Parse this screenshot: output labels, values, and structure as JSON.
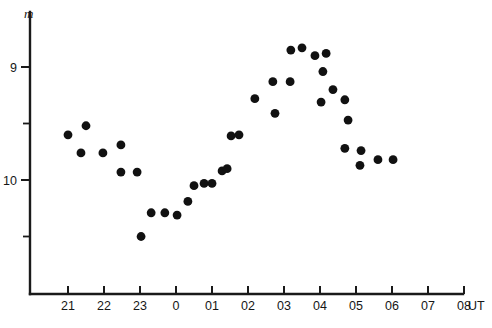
{
  "chart_data": {
    "type": "scatter",
    "title": "",
    "subtitle": "",
    "xlabel": "UT",
    "ylabel": "m",
    "y_axis_inverted": true,
    "grid": false,
    "legend": null,
    "xlim": [
      20.55,
      28.6
    ],
    "ylim_display_top": 8.79,
    "ylim_display_bottom": 10.51,
    "x_tick_labels": [
      "21",
      "22",
      "23",
      "0",
      "01",
      "02",
      "03",
      "04",
      "05",
      "06",
      "07",
      "08"
    ],
    "x_tick_values": [
      21,
      22,
      23,
      24,
      25,
      26,
      27,
      28,
      29,
      30,
      31,
      32
    ],
    "x_unit_label": "UT",
    "y_tick_labels": [
      "9",
      "10"
    ],
    "y_tick_values": [
      9,
      10
    ],
    "y_minor_tick_values": [
      9.5,
      10.5
    ],
    "points": [
      {
        "x": 21.0,
        "y": 9.6
      },
      {
        "x": 21.5,
        "y": 9.52
      },
      {
        "x": 21.36,
        "y": 9.76
      },
      {
        "x": 21.97,
        "y": 9.76
      },
      {
        "x": 22.47,
        "y": 9.69
      },
      {
        "x": 22.47,
        "y": 9.93
      },
      {
        "x": 22.92,
        "y": 9.93
      },
      {
        "x": 23.03,
        "y": 10.5
      },
      {
        "x": 23.31,
        "y": 10.29
      },
      {
        "x": 23.69,
        "y": 10.29
      },
      {
        "x": 24.03,
        "y": 10.31
      },
      {
        "x": 24.33,
        "y": 10.19
      },
      {
        "x": 24.5,
        "y": 10.05
      },
      {
        "x": 24.78,
        "y": 10.03
      },
      {
        "x": 25.0,
        "y": 10.03
      },
      {
        "x": 25.28,
        "y": 9.92
      },
      {
        "x": 25.42,
        "y": 9.9
      },
      {
        "x": 25.53,
        "y": 9.61
      },
      {
        "x": 25.75,
        "y": 9.6
      },
      {
        "x": 26.19,
        "y": 9.28
      },
      {
        "x": 26.69,
        "y": 9.13
      },
      {
        "x": 26.75,
        "y": 9.41
      },
      {
        "x": 27.17,
        "y": 9.13
      },
      {
        "x": 27.19,
        "y": 8.85
      },
      {
        "x": 27.5,
        "y": 8.83
      },
      {
        "x": 27.86,
        "y": 8.9
      },
      {
        "x": 28.08,
        "y": 9.04
      },
      {
        "x": 28.03,
        "y": 9.31
      },
      {
        "x": 28.17,
        "y": 8.88
      },
      {
        "x": 28.36,
        "y": 9.2
      },
      {
        "x": 28.69,
        "y": 9.29
      },
      {
        "x": 28.78,
        "y": 9.47
      },
      {
        "x": 28.69,
        "y": 9.72
      },
      {
        "x": 29.14,
        "y": 9.74
      },
      {
        "x": 29.11,
        "y": 9.87
      },
      {
        "x": 29.61,
        "y": 9.82
      },
      {
        "x": 30.03,
        "y": 9.82
      }
    ]
  },
  "axis": {
    "y_title": "m",
    "x_unit": "UT"
  }
}
